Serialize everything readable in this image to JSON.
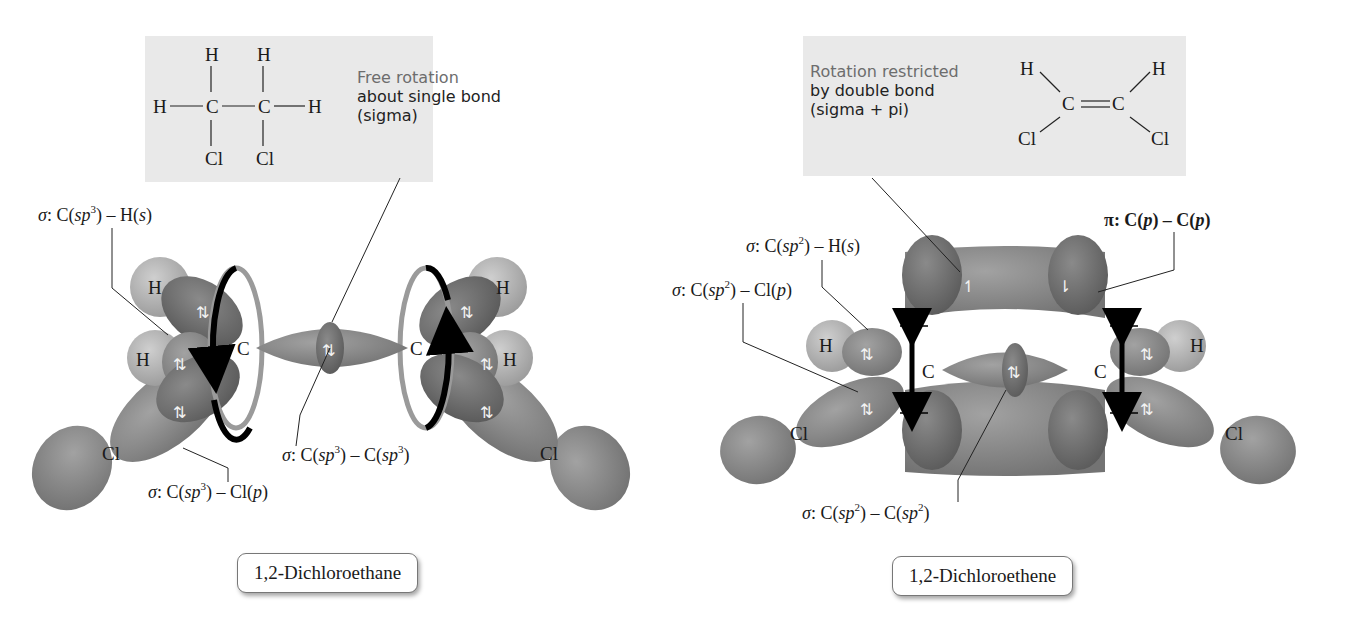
{
  "figure": {
    "left_panel": {
      "molecule_name": "1,2-Dichloroethane",
      "structure": {
        "row1": "H     H",
        "row2": "H—C—C—H",
        "row3": "Cl    Cl",
        "atoms": {
          "H": "H",
          "C": "C",
          "Cl": "Cl"
        }
      },
      "note": {
        "line1": "Free rotation",
        "line2": "about single bond",
        "line3": "(sigma)"
      },
      "labels": {
        "ch": {
          "sigma": "σ",
          "text_pre": ": C(",
          "hyb": "sp",
          "sup": "3",
          "text_post": ") – H(",
          "orb": "s",
          "close": ")"
        },
        "ccl": {
          "sigma": "σ",
          "text_pre": ": C(",
          "hyb": "sp",
          "sup": "3",
          "text_post": ") – Cl(",
          "orb": "p",
          "close": ")"
        },
        "cc": {
          "sigma": "σ",
          "text_pre": ": C(",
          "hyb": "sp",
          "sup": "3",
          "text_mid": ") – C(",
          "hyb2": "sp",
          "sup2": "3",
          "close": ")"
        }
      },
      "atom_labels": {
        "H_top": "H",
        "H_mid": "H",
        "C_left": "C",
        "C_right": "C",
        "Cl_left": "Cl",
        "Cl_right": "Cl",
        "H_top_r": "H",
        "H_mid_r": "H"
      },
      "electron_pair": "⇅"
    },
    "right_panel": {
      "molecule_name": "1,2-Dichloroethene",
      "structure": {
        "H_left": "H",
        "H_right": "H",
        "C_left": "C",
        "double_bond": "=",
        "C_right": "C",
        "Cl_left": "Cl",
        "Cl_right": "Cl"
      },
      "note": {
        "line1": "Rotation restricted",
        "line2": "by double bond",
        "line3": "(sigma + pi)"
      },
      "labels": {
        "ch": {
          "sigma": "σ",
          "text_pre": ": C(",
          "hyb": "sp",
          "sup": "2",
          "text_post": ") – H(",
          "orb": "s",
          "close": ")"
        },
        "ccl": {
          "sigma": "σ",
          "text_pre": ": C(",
          "hyb": "sp",
          "sup": "2",
          "text_post": ") – Cl(",
          "orb": "p",
          "close": ")"
        },
        "cc": {
          "sigma": "σ",
          "text_pre": ": C(",
          "hyb": "sp",
          "sup": "2",
          "text_mid": ") – C(",
          "hyb2": "sp",
          "sup2": "2",
          "close": ")"
        },
        "pi": {
          "pi": "π",
          "text": ": C(",
          "orb": "p",
          "mid": ") – C(",
          "orb2": "p",
          "close": ")"
        }
      },
      "atom_labels": {
        "H_left": "H",
        "H_right": "H",
        "C_left": "C",
        "C_right": "C",
        "Cl_left": "Cl",
        "Cl_right": "Cl"
      },
      "spin_up": "↿",
      "spin_down": "⇂"
    },
    "colors": {
      "note_box": "#e9e9e9",
      "lobe_dark": "#6e6e6e",
      "lobe_mid": "#888888",
      "lobe_light": "#a8a8a8",
      "h_sphere": "#b9b9b9",
      "arrow": "#000000",
      "ring_gray": "#9a9a9a"
    }
  }
}
